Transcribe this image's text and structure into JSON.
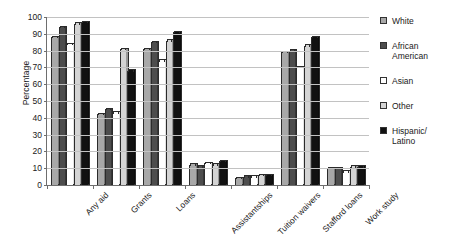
{
  "chart_data": {
    "type": "bar",
    "title": "",
    "xlabel": "",
    "ylabel": "Percentage",
    "ylim": [
      0,
      100
    ],
    "ytick_step": 10,
    "yticks": [
      0,
      10,
      20,
      30,
      40,
      50,
      60,
      70,
      80,
      90,
      100
    ],
    "grid": true,
    "legend_position": "right",
    "categories": [
      "Any aid",
      "Grants",
      "Loans",
      "Assistantships",
      "Tuition waivers",
      "Stafford loans",
      "Work study"
    ],
    "series": [
      {
        "name": "White",
        "color": "#a8a8a8",
        "values": [
          88,
          42,
          81,
          12,
          4,
          79,
          10
        ]
      },
      {
        "name": "African American",
        "color": "#4d4d4d",
        "values": [
          94,
          45,
          85,
          11,
          5,
          80,
          10
        ]
      },
      {
        "name": "Asian",
        "color": "#ffffff",
        "values": [
          84,
          43,
          74,
          13,
          5,
          70,
          8
        ]
      },
      {
        "name": "Other",
        "color": "#d4d4d4",
        "values": [
          96,
          81,
          86,
          12,
          6,
          83,
          11
        ]
      },
      {
        "name": "Hispanic/\nLatino",
        "color": "#111111",
        "values": [
          97,
          68,
          91,
          14,
          6,
          88,
          11
        ]
      }
    ]
  },
  "axis": {
    "y_title": "Percentage"
  },
  "legend": {
    "entries": [
      {
        "label": "White"
      },
      {
        "label": "African\nAmerican"
      },
      {
        "label": "Asian"
      },
      {
        "label": "Other"
      },
      {
        "label": "Hispanic/\nLatino"
      }
    ]
  }
}
